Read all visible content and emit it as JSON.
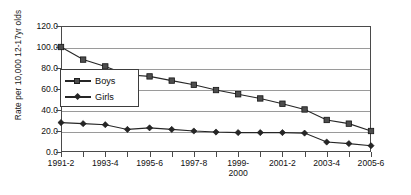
{
  "chart_data": {
    "type": "line",
    "title": "",
    "subtitle": "",
    "xlabel": "",
    "ylabel": "Rate per 10,000 12-17yr olds",
    "ylim": [
      0,
      120
    ],
    "ytick_labels": [
      "120.0",
      "100.0",
      "80.0",
      "60.0",
      "40.0",
      "20.0",
      "0.0"
    ],
    "ytick_values": [
      120,
      100,
      80,
      60,
      40,
      20,
      0
    ],
    "grid": "horizontal",
    "legend_position": "inside-upper-left",
    "x": [
      "1991-2",
      "1992-3",
      "1993-4",
      "1994-5",
      "1995-6",
      "1996-7",
      "1997-8",
      "1998-9",
      "1999-2000",
      "2000-1",
      "2001-2",
      "2002-3",
      "2003-4",
      "2004-5",
      "2005-6"
    ],
    "xtick_labels_shown": [
      "1991-2",
      "",
      "1993-4",
      "",
      "1995-6",
      "",
      "1997-8",
      "",
      "1999-\n2000",
      "",
      "2001-2",
      "",
      "2003-4",
      "",
      "2005-6"
    ],
    "categories": [
      "1991-2",
      "1992-3",
      "1993-4",
      "1994-5",
      "1995-6",
      "1996-7",
      "1997-8",
      "1998-9",
      "1999-2000",
      "2000-1",
      "2001-2",
      "2002-3",
      "2003-4",
      "2004-5",
      "2005-6"
    ],
    "series": [
      {
        "name": "Boys",
        "marker": "square",
        "color": "#4d4d4d",
        "values": [
          100.0,
          88.0,
          81.5,
          73.5,
          72.0,
          68.0,
          64.0,
          59.0,
          55.0,
          51.0,
          46.0,
          40.5,
          30.5,
          27.0,
          20.0
        ]
      },
      {
        "name": "Girls",
        "marker": "diamond",
        "color": "#262626",
        "values": [
          28.0,
          27.0,
          26.0,
          21.5,
          23.0,
          21.5,
          20.0,
          19.0,
          18.5,
          18.5,
          18.5,
          18.0,
          9.5,
          8.0,
          6.0
        ]
      }
    ]
  },
  "legend": {
    "items": [
      {
        "label": "Boys"
      },
      {
        "label": "Girls"
      }
    ]
  }
}
